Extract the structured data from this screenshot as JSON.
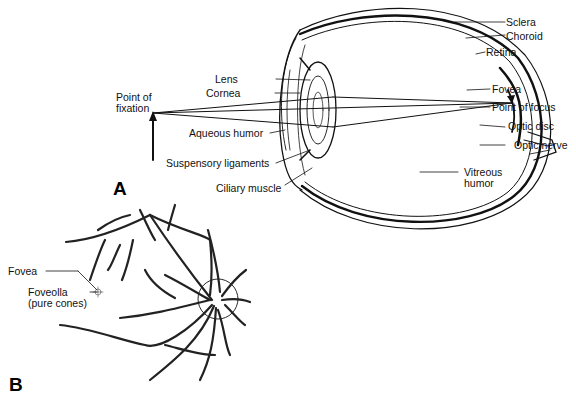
{
  "panel_a": {
    "letter": "A",
    "labels": {
      "sclera": "Sclera",
      "choroid": "Choroid",
      "retina": "Retina",
      "fovea": "Fovea",
      "point_of_focus": "Point of focus",
      "optic_disc": "Optic disc",
      "optic_nerve": "Optic nerve",
      "vitreous_1": "Vitreous",
      "vitreous_2": "humor",
      "lens": "Lens",
      "cornea": "Cornea",
      "fixation_1": "Point of",
      "fixation_2": "fixation",
      "aqueous_humor": "Aqueous humor",
      "suspensory_ligaments": "Suspensory ligaments",
      "ciliary_muscle": "Ciliary muscle"
    }
  },
  "panel_b": {
    "letter": "B",
    "labels": {
      "fovea": "Fovea",
      "foveolla_1": "Foveolla",
      "foveolla_2": "(pure cones)"
    }
  }
}
